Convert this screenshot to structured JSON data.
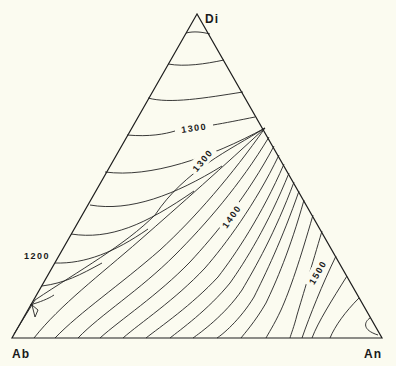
{
  "diagram": {
    "type": "ternary-phase-diagram",
    "vertices": {
      "top": "Di",
      "bottom_left": "Ab",
      "bottom_right": "An"
    },
    "isotherm_labels": [
      {
        "id": "t1300_upper",
        "text": "1300"
      },
      {
        "id": "t1200",
        "text": "1200"
      },
      {
        "id": "t1300_lower",
        "text": "1300"
      },
      {
        "id": "t1400",
        "text": "1400"
      },
      {
        "id": "t1500",
        "text": "1500"
      }
    ],
    "colors": {
      "background": "#fbfbf0",
      "line": "#1e1e1e"
    }
  }
}
